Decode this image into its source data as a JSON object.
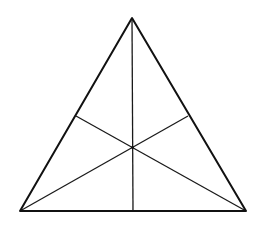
{
  "diagram": {
    "type": "geometry",
    "shape": "triangle",
    "vertices": [
      "A (apex)",
      "B (bottom-left)",
      "C (bottom-right)"
    ],
    "edges": [
      {
        "name": "AB",
        "from": "A",
        "to": "B"
      },
      {
        "name": "AC",
        "from": "A",
        "to": "C"
      },
      {
        "name": "BC",
        "from": "B",
        "to": "C"
      }
    ],
    "medians": [
      {
        "from": "A",
        "to": "midpoint of BC"
      },
      {
        "from": "B",
        "to": "midpoint of AC"
      },
      {
        "from": "C",
        "to": "midpoint of AB"
      }
    ],
    "intersection": "centroid",
    "labels": [],
    "colors": {
      "stroke": "#111111",
      "background": "#ffffff"
    }
  }
}
